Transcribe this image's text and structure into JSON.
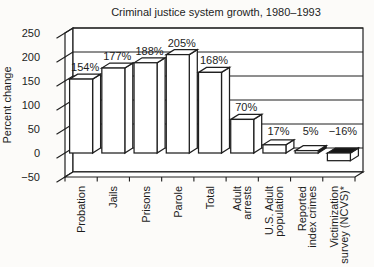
{
  "figure": {
    "background": "#fcfbf9",
    "ink": "#1f1f1f"
  },
  "chart_data": {
    "type": "bar",
    "projection": "3d",
    "title": "Criminal justice system growth, 1980–1993",
    "xlabel": "",
    "ylabel": "Percent change",
    "ylim": [
      -50,
      250
    ],
    "ytick_step": 50,
    "yticks": [
      250,
      200,
      150,
      100,
      50,
      0,
      -50
    ],
    "grid": true,
    "legend_position": "none",
    "categories": [
      "Probation",
      "Jails",
      "Prisons",
      "Parole",
      "Total",
      "Adult arrests",
      "U.S. Adult population",
      "Reported index crimes",
      "Victimization survey (NCVS)*"
    ],
    "category_label_lines": [
      [
        "Probation"
      ],
      [
        "Jails"
      ],
      [
        "Prisons"
      ],
      [
        "Parole"
      ],
      [
        "Total"
      ],
      [
        "Adult",
        "arrests"
      ],
      [
        "U.S. Adult",
        "population"
      ],
      [
        "Reported",
        "index crimes"
      ],
      [
        "Victimization",
        "survey (NCVS)*"
      ]
    ],
    "values": [
      154,
      177,
      188,
      205,
      168,
      70,
      17,
      5,
      -16
    ],
    "bar_labels": [
      "154%",
      "177%",
      "188%",
      "205%",
      "168%",
      "70%",
      "17%",
      "5%",
      "−16%"
    ],
    "bar_fill": "#ffffff",
    "negative_top_fill": "#161616",
    "shaded_side_categories": [
      "Reported index crimes"
    ]
  }
}
